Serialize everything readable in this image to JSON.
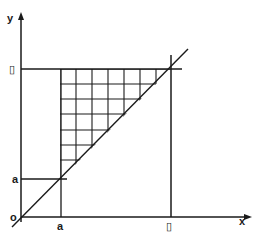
{
  "diagram": {
    "type": "integration-region",
    "axes": {
      "x_label": "x",
      "y_label": "y",
      "origin_label": "o"
    },
    "labels": {
      "x_a": "a",
      "x_b": "▯",
      "y_a": "a",
      "y_b": "▯"
    },
    "colors": {
      "line": "#1a1a1a",
      "background": "#ffffff"
    },
    "geometry": {
      "origin": [
        21,
        217
      ],
      "x_axis_end": [
        250,
        217
      ],
      "y_axis_end": [
        21,
        14
      ],
      "diagonal": [
        [
          12,
          227
        ],
        [
          188,
          49
        ]
      ],
      "grid_x": [
        60,
        76,
        92,
        108,
        124,
        140,
        156
      ],
      "grid_y": [
        69,
        84,
        99,
        114,
        130,
        145,
        160
      ],
      "a_px": 61,
      "a_py": 179,
      "b_px": 171,
      "b_py": 69
    }
  }
}
